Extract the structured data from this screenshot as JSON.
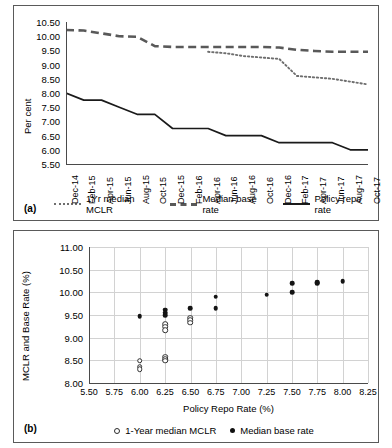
{
  "figure": {
    "panel_a_label": "(a)",
    "panel_b_label": "(b)"
  },
  "chart_data": [
    {
      "id": "panel_a",
      "type": "line",
      "title": "",
      "xlabel": "",
      "ylabel": "Per cent",
      "ylim": [
        5.5,
        10.5
      ],
      "ytick_labels": [
        "10.50",
        "10.00",
        "9.50",
        "9.00",
        "8.50",
        "8.00",
        "7.50",
        "7.00",
        "6.50",
        "6.00",
        "5.50"
      ],
      "yticks": [
        10.5,
        10.0,
        9.5,
        9.0,
        8.5,
        8.0,
        7.5,
        7.0,
        6.5,
        6.0,
        5.5
      ],
      "grid": false,
      "legend_position": "bottom",
      "categories": [
        "Dec-14",
        "Feb-15",
        "Apr-15",
        "Jun-15",
        "Aug-15",
        "Oct-15",
        "Dec-15",
        "Feb-16",
        "Apr-16",
        "Jun-16",
        "Aug-16",
        "Oct-16",
        "Dec-16",
        "Feb-17",
        "Apr-17",
        "Jun-17",
        "Aug-17",
        "Oct-17"
      ],
      "series": [
        {
          "name": "1Yr median MCLR",
          "style": "dotted",
          "color": "#6e6e6e",
          "values": [
            null,
            null,
            null,
            null,
            null,
            null,
            null,
            null,
            9.45,
            9.4,
            9.3,
            9.25,
            9.2,
            8.6,
            8.55,
            8.5,
            8.4,
            8.3
          ]
        },
        {
          "name": "Median base rate",
          "style": "dashed",
          "color": "#595959",
          "values": [
            10.22,
            10.2,
            10.1,
            10.0,
            9.98,
            9.65,
            9.62,
            9.62,
            9.62,
            9.62,
            9.62,
            9.62,
            9.6,
            9.52,
            9.48,
            9.45,
            9.45,
            9.45
          ]
        },
        {
          "name": "Policy repo rate",
          "style": "solid",
          "color": "#1a1a1a",
          "values": [
            8.0,
            7.75,
            7.75,
            7.5,
            7.25,
            7.25,
            6.75,
            6.75,
            6.75,
            6.5,
            6.5,
            6.5,
            6.25,
            6.25,
            6.25,
            6.25,
            6.0,
            6.0
          ]
        }
      ]
    },
    {
      "id": "panel_b",
      "type": "scatter",
      "title": "",
      "xlabel": "Policy Repo Rate (%)",
      "ylabel": "MCLR and Base Rate (%)",
      "xlim": [
        5.5,
        8.25
      ],
      "ylim": [
        8.0,
        11.0
      ],
      "xtick_labels": [
        "5.50",
        "5.75",
        "6.00",
        "6.25",
        "6.50",
        "6.75",
        "7.00",
        "7.25",
        "7.50",
        "7.75",
        "8.00",
        "8.25"
      ],
      "xticks": [
        5.5,
        5.75,
        6.0,
        6.25,
        6.5,
        6.75,
        7.0,
        7.25,
        7.5,
        7.75,
        8.0,
        8.25
      ],
      "ytick_labels": [
        "11.00",
        "10.50",
        "10.00",
        "9.50",
        "9.00",
        "8.50",
        "8.00"
      ],
      "yticks": [
        11.0,
        10.5,
        10.0,
        9.5,
        9.0,
        8.5,
        8.0
      ],
      "grid": true,
      "legend_position": "bottom",
      "series": [
        {
          "name": "1-Year median MCLR",
          "marker": "open",
          "points": [
            [
              6.0,
              8.49
            ],
            [
              6.0,
              8.36
            ],
            [
              6.0,
              8.3
            ],
            [
              6.25,
              8.58
            ],
            [
              6.25,
              8.52
            ],
            [
              6.25,
              8.49
            ],
            [
              6.25,
              9.3
            ],
            [
              6.25,
              9.24
            ],
            [
              6.25,
              9.16
            ],
            [
              6.5,
              9.44
            ],
            [
              6.5,
              9.38
            ],
            [
              6.5,
              9.33
            ]
          ]
        },
        {
          "name": "Median base rate",
          "marker": "filled",
          "points": [
            [
              6.0,
              9.47
            ],
            [
              6.25,
              9.62
            ],
            [
              6.25,
              9.55
            ],
            [
              6.25,
              9.49
            ],
            [
              6.5,
              9.65
            ],
            [
              6.75,
              9.9
            ],
            [
              6.75,
              9.65
            ],
            [
              7.25,
              9.95
            ],
            [
              7.5,
              10.2
            ],
            [
              7.5,
              10.0
            ],
            [
              7.75,
              10.22
            ],
            [
              7.75,
              10.2
            ],
            [
              8.0,
              10.24
            ]
          ]
        }
      ]
    }
  ]
}
